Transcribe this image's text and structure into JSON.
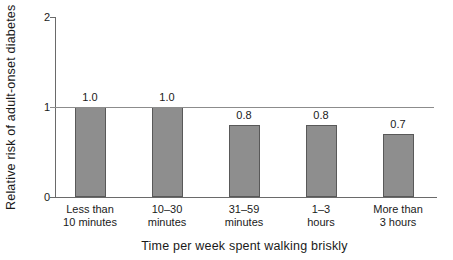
{
  "chart_data": {
    "type": "bar",
    "title": "",
    "ylabel": "Relative risk of adult-onset diabetes",
    "xlabel": "Time per week spent walking briskly",
    "categories": [
      "Less than\n10 minutes",
      "10–30\nminutes",
      "31–59\nminutes",
      "1–3\nhours",
      "More than\n3 hours"
    ],
    "values": [
      1.0,
      1.0,
      0.8,
      0.8,
      0.7
    ],
    "value_labels": [
      "1.0",
      "1.0",
      "0.8",
      "0.8",
      "0.7"
    ],
    "ylim": [
      0,
      2
    ],
    "yticks": [
      0,
      1,
      2
    ],
    "reference_line_y": 1,
    "grid": false,
    "legend": "none",
    "colors": {
      "bar_fill": "#8e8e8e",
      "bar_border": "#595959",
      "axis": "#6a6a6a",
      "reference_line": "#8c8c8c",
      "text": "#1a1a1a",
      "background": "#ffffff"
    }
  }
}
